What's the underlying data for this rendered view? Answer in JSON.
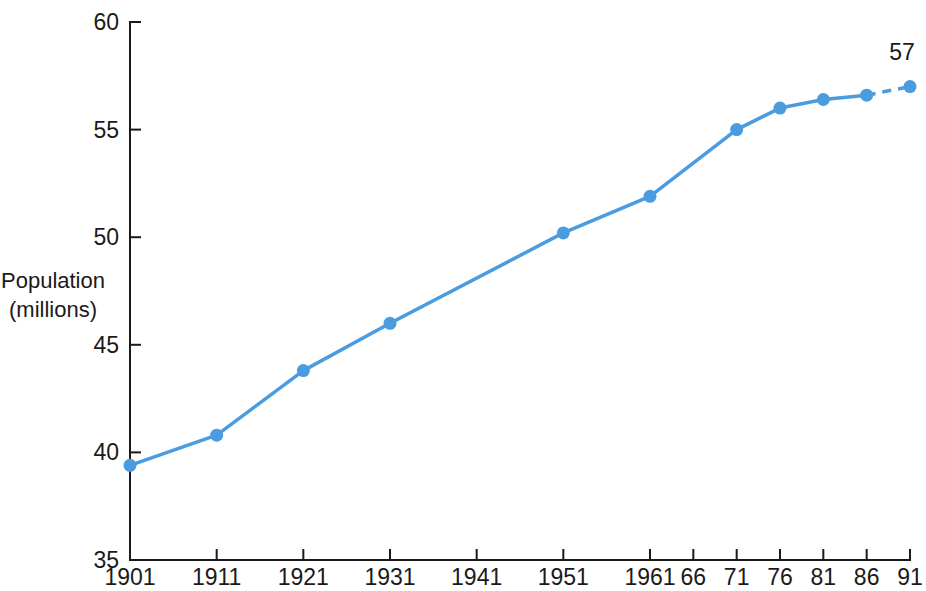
{
  "chart_data": {
    "type": "line",
    "title": "",
    "xlabel": "",
    "ylabel": "Population\n(millions)",
    "ylabel_line1": "Population",
    "ylabel_line2": "(millions)",
    "x": [
      1901,
      1911,
      1921,
      1931,
      1941,
      1951,
      1961,
      1966,
      1971,
      1976,
      1981,
      1986,
      1991
    ],
    "categories": [
      "1901",
      "1911",
      "1921",
      "1931",
      "1941",
      "1951",
      "1961",
      "66",
      "71",
      "76",
      "81",
      "86",
      "91"
    ],
    "values": [
      39.4,
      40.8,
      43.8,
      46.0,
      null,
      50.2,
      51.9,
      null,
      55.0,
      56.0,
      56.4,
      56.6,
      57.0
    ],
    "series": [
      {
        "name": "Population (millions)",
        "points": [
          {
            "x": 1901,
            "label": "1901",
            "y": 39.4,
            "marker": true,
            "projected": false
          },
          {
            "x": 1911,
            "label": "1911",
            "y": 40.8,
            "marker": true,
            "projected": false
          },
          {
            "x": 1921,
            "label": "1921",
            "y": 43.8,
            "marker": true,
            "projected": false
          },
          {
            "x": 1931,
            "label": "1931",
            "y": 46.0,
            "marker": true,
            "projected": false
          },
          {
            "x": 1941,
            "label": "1941",
            "y": null,
            "marker": false,
            "projected": false
          },
          {
            "x": 1951,
            "label": "1951",
            "y": 50.2,
            "marker": true,
            "projected": false
          },
          {
            "x": 1961,
            "label": "1961",
            "y": 51.9,
            "marker": true,
            "projected": false
          },
          {
            "x": 1966,
            "label": "66",
            "y": null,
            "marker": false,
            "projected": false
          },
          {
            "x": 1971,
            "label": "71",
            "y": 55.0,
            "marker": true,
            "projected": false
          },
          {
            "x": 1976,
            "label": "76",
            "y": 56.0,
            "marker": true,
            "projected": false
          },
          {
            "x": 1981,
            "label": "81",
            "y": 56.4,
            "marker": true,
            "projected": false
          },
          {
            "x": 1986,
            "label": "86",
            "y": 56.6,
            "marker": true,
            "projected": false
          },
          {
            "x": 1991,
            "label": "91",
            "y": 57.0,
            "marker": true,
            "projected": true
          }
        ]
      }
    ],
    "yticks": [
      35,
      40,
      45,
      50,
      55,
      60
    ],
    "ytick_labels": [
      "35",
      "40",
      "45",
      "50",
      "55",
      "60"
    ],
    "ylim": [
      35,
      60
    ],
    "xlim": [
      1901,
      1991
    ],
    "xticks": [
      1901,
      1911,
      1921,
      1931,
      1941,
      1951,
      1961,
      1966,
      1971,
      1976,
      1981,
      1986,
      1991
    ],
    "grid": false,
    "legend": false,
    "annotations": [
      {
        "text": "57",
        "x": 1991,
        "y": 57.0,
        "name": "final-value-label"
      }
    ],
    "notes": {
      "missing_point_1941": "No marker plotted at 1941",
      "missing_point_1966": "No marker plotted at 1966",
      "dashed_segment": "1986 to 1991 drawn as dashed line"
    },
    "colors": {
      "line": "#4a9ce0",
      "marker": "#4a9ce0",
      "axis": "#1a1a1a",
      "text": "#1a1a1a",
      "background": "#ffffff"
    }
  }
}
